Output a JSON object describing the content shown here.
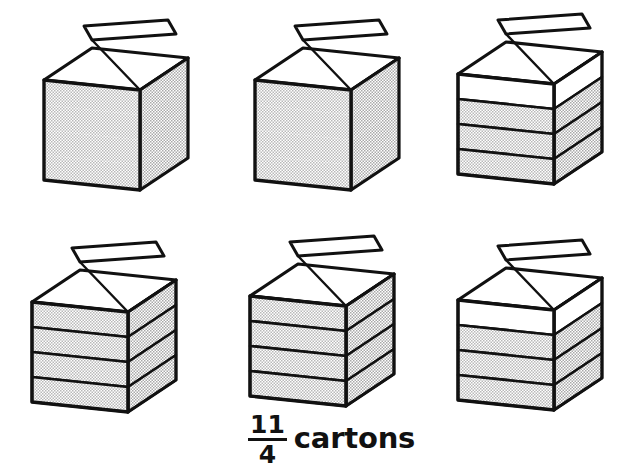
{
  "figure": {
    "kind": "fraction-model-illustration",
    "background_color": "#ffffff",
    "ink_color": "#111111",
    "fill_pattern_color": "#b9b9b9",
    "empty_color": "#ffffff",
    "denominator_partitions": 4
  },
  "caption": {
    "numerator": "11",
    "denominator": "4",
    "unit": "cartons",
    "full_text": "11/4 cartons"
  },
  "cartons": [
    {
      "index": 1,
      "row": 1,
      "column": 1,
      "name": "carton-1",
      "filled_fourths": 4,
      "show_partition_lines": false,
      "x": 36,
      "y": 18,
      "width": 160,
      "height": 190
    },
    {
      "index": 2,
      "row": 1,
      "column": 2,
      "name": "carton-2",
      "filled_fourths": 4,
      "show_partition_lines": false,
      "x": 247,
      "y": 18,
      "width": 160,
      "height": 190
    },
    {
      "index": 3,
      "row": 1,
      "column": 3,
      "name": "carton-3",
      "filled_fourths": 3,
      "show_partition_lines": true,
      "x": 450,
      "y": 12,
      "width": 160,
      "height": 190
    },
    {
      "index": 4,
      "row": 2,
      "column": 1,
      "name": "carton-4",
      "filled_fourths": 4,
      "show_partition_lines": true,
      "x": 24,
      "y": 240,
      "width": 160,
      "height": 190
    },
    {
      "index": 5,
      "row": 2,
      "column": 2,
      "name": "carton-5",
      "filled_fourths": 4,
      "show_partition_lines": true,
      "x": 242,
      "y": 234,
      "width": 160,
      "height": 190
    },
    {
      "index": 6,
      "row": 2,
      "column": 3,
      "name": "carton-6",
      "filled_fourths": 3,
      "show_partition_lines": true,
      "x": 450,
      "y": 238,
      "width": 160,
      "height": 190
    }
  ],
  "caption_position": {
    "x": 248,
    "y": 411
  }
}
